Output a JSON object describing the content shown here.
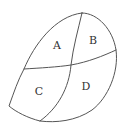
{
  "diagram": {
    "type": "region-partition",
    "stroke_color": "#555555",
    "label_color": "#333333",
    "regions": [
      {
        "id": "A",
        "label": "A",
        "x": 57,
        "y": 49
      },
      {
        "id": "B",
        "label": "B",
        "x": 93,
        "y": 44
      },
      {
        "id": "C",
        "label": "C",
        "x": 39,
        "y": 95
      },
      {
        "id": "D",
        "label": "D",
        "x": 86,
        "y": 90
      }
    ],
    "key_points": {
      "top_junction": [
        82,
        13
      ],
      "right_junction": [
        116,
        50
      ],
      "left_junction": [
        24,
        69
      ],
      "center_crossing": [
        71,
        65
      ],
      "lower_left_corner": [
        9,
        106
      ],
      "bottom_junction": [
        40,
        121
      ]
    }
  }
}
